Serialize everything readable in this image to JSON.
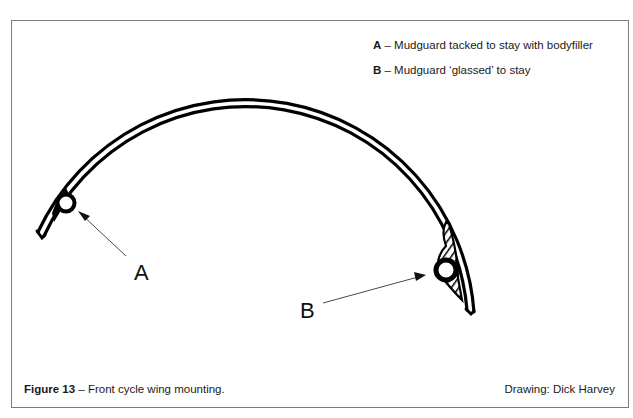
{
  "figure": {
    "legend": [
      {
        "key": "A",
        "text": " – Mudguard tacked to stay with bodyfiller"
      },
      {
        "key": "B",
        "text": " – Mudguard ‘glassed’ to stay"
      }
    ],
    "callouts": {
      "a": "A",
      "b": "B"
    },
    "caption": {
      "label": "Figure 13",
      "text": " – Front cycle wing mounting."
    },
    "credit": "Drawing: Dick Harvey"
  }
}
